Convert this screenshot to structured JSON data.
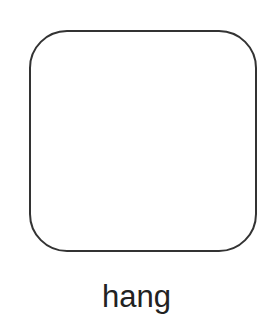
{
  "figure": {
    "shape": {
      "type": "rounded-square",
      "fill": "#ffffff",
      "stroke": "#333333"
    },
    "caption": "hang"
  }
}
